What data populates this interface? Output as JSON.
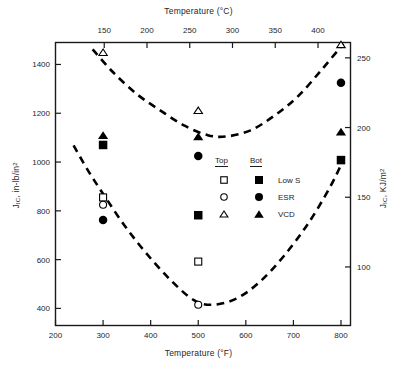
{
  "chart_data": {
    "type": "scatter",
    "title": "",
    "xlabel": "Temperature (°F)",
    "ylabel": "J_IC, in-lb/in2",
    "x2label": "Temperature (°C)",
    "y2label": "J_IC, KJ/m2",
    "xlim": [
      200,
      820
    ],
    "ylim": [
      330,
      1490
    ],
    "x2lim": [
      93,
      438
    ],
    "y2lim": [
      58,
      261
    ],
    "xticks": [
      200,
      300,
      400,
      500,
      600,
      700,
      800
    ],
    "x2ticks": [
      150,
      200,
      250,
      300,
      350,
      400
    ],
    "yticks": [
      400,
      600,
      800,
      1000,
      1200,
      1400
    ],
    "y2ticks": [
      100,
      150,
      200,
      250
    ],
    "grid": false,
    "legend_position": "center-right inside axes",
    "series": [
      {
        "name": "Low S Top",
        "marker": "open-square",
        "points": [
          {
            "x": 300,
            "y": 855
          },
          {
            "x": 500,
            "y": 592
          }
        ]
      },
      {
        "name": "Low S Bot",
        "marker": "filled-square",
        "points": [
          {
            "x": 300,
            "y": 1070
          },
          {
            "x": 500,
            "y": 782
          },
          {
            "x": 800,
            "y": 1008
          }
        ]
      },
      {
        "name": "ESR Top",
        "marker": "open-circle",
        "points": [
          {
            "x": 300,
            "y": 825
          },
          {
            "x": 500,
            "y": 415
          }
        ]
      },
      {
        "name": "ESR Bot",
        "marker": "filled-circle",
        "points": [
          {
            "x": 300,
            "y": 762
          },
          {
            "x": 500,
            "y": 1025
          },
          {
            "x": 800,
            "y": 1325
          }
        ]
      },
      {
        "name": "VCD Top",
        "marker": "open-triangle",
        "points": [
          {
            "x": 300,
            "y": 1450
          },
          {
            "x": 500,
            "y": 1212
          },
          {
            "x": 800,
            "y": 1482
          }
        ]
      },
      {
        "name": "VCD Bot",
        "marker": "filled-triangle",
        "points": [
          {
            "x": 300,
            "y": 1110
          },
          {
            "x": 500,
            "y": 1105
          },
          {
            "x": 800,
            "y": 1125
          }
        ]
      }
    ],
    "trend_curves": [
      {
        "name": "upper-dashed-curve",
        "style": "dashed",
        "points": [
          {
            "x": 278,
            "y": 1462
          },
          {
            "x": 320,
            "y": 1370
          },
          {
            "x": 370,
            "y": 1280
          },
          {
            "x": 420,
            "y": 1212
          },
          {
            "x": 470,
            "y": 1150
          },
          {
            "x": 520,
            "y": 1110
          },
          {
            "x": 560,
            "y": 1105
          },
          {
            "x": 610,
            "y": 1130
          },
          {
            "x": 660,
            "y": 1190
          },
          {
            "x": 710,
            "y": 1270
          },
          {
            "x": 760,
            "y": 1380
          },
          {
            "x": 805,
            "y": 1485
          }
        ]
      },
      {
        "name": "lower-dashed-curve",
        "style": "dashed",
        "points": [
          {
            "x": 238,
            "y": 1068
          },
          {
            "x": 270,
            "y": 960
          },
          {
            "x": 305,
            "y": 855
          },
          {
            "x": 345,
            "y": 740
          },
          {
            "x": 390,
            "y": 628
          },
          {
            "x": 440,
            "y": 520
          },
          {
            "x": 490,
            "y": 435
          },
          {
            "x": 530,
            "y": 415
          },
          {
            "x": 580,
            "y": 440
          },
          {
            "x": 630,
            "y": 510
          },
          {
            "x": 680,
            "y": 615
          },
          {
            "x": 730,
            "y": 745
          },
          {
            "x": 775,
            "y": 890
          },
          {
            "x": 803,
            "y": 1000
          }
        ]
      }
    ],
    "legend": {
      "col_headers": [
        "Top",
        "Bot"
      ],
      "rows": [
        {
          "label": "Low S",
          "top_marker": "open-square",
          "bot_marker": "filled-square"
        },
        {
          "label": "ESR",
          "top_marker": "open-circle",
          "bot_marker": "filled-circle"
        },
        {
          "label": "VCD",
          "top_marker": "open-triangle",
          "bot_marker": "filled-triangle"
        }
      ]
    },
    "colors": {
      "axis": "#1a1a1a",
      "marker": "#000000",
      "curve": "#000000",
      "background": "#ffffff"
    }
  },
  "axes": {
    "top": {
      "title_main": "Temperature (",
      "title_unit": "°C)",
      "ticks": [
        "150",
        "200",
        "250",
        "300",
        "350",
        "400"
      ]
    },
    "bottom": {
      "title_main": "Temperature (",
      "title_unit": "°F)",
      "ticks": [
        "200",
        "300",
        "400",
        "500",
        "600",
        "700",
        "800"
      ]
    },
    "left": {
      "title_prefix": "J",
      "title_sub": "IC",
      "title_mid": ", in-lb/in",
      "title_sup": "2",
      "ticks": [
        "1400",
        "1200",
        "1000",
        "800",
        "600",
        "400"
      ]
    },
    "right": {
      "title_prefix": "J",
      "title_sub": "IC",
      "title_mid": ", KJ/m",
      "title_sup": "2",
      "ticks": [
        "250",
        "200",
        "150",
        "100"
      ]
    }
  },
  "legend": {
    "header_top": "Top",
    "header_bot": "Bot",
    "row1_label": "Low S",
    "row2_label": "ESR",
    "row3_label": "VCD"
  }
}
